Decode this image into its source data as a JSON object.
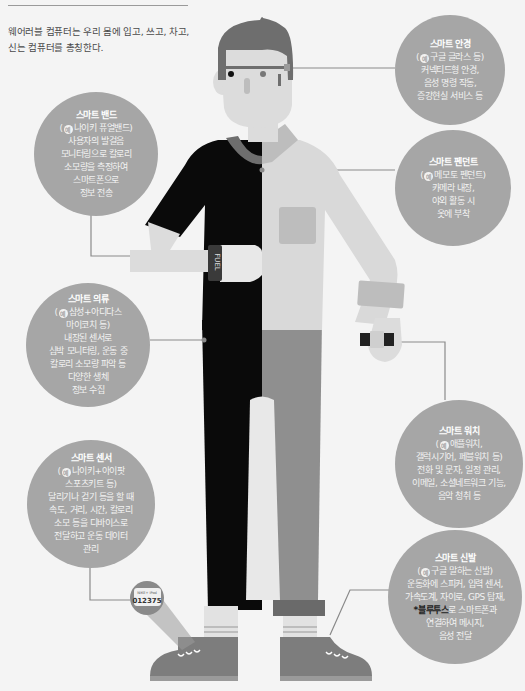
{
  "intro": {
    "line1": "웨어러블 컴퓨터는 우리 몸에 입고, 쓰고, 차고,",
    "line2": "신는 컴퓨터를 총칭한다."
  },
  "example_badge": "예",
  "callouts": {
    "glasses": {
      "title": "스마트 안경",
      "example": "구글 글라스 등)",
      "lines": [
        "커넥티드형 안경,",
        "음성 명령 작동,",
        "증강현실 서비스 등"
      ]
    },
    "band": {
      "title": "스마트 밴드",
      "example": "나이키 퓨얼밴드)",
      "lines": [
        "사용자의 발걸음",
        "모니터링으로 칼로리",
        "소모량을 측정하여",
        "스마트폰으로",
        "정보 전송"
      ]
    },
    "pendant": {
      "title": "스마트 펜던트",
      "example": "메모토 펜던트)",
      "lines": [
        "카메라 내장,",
        "야외 활동 시",
        "옷에 부착"
      ]
    },
    "clothing": {
      "title": "스마트 의류",
      "example": "삼성+아디다스",
      "lines": [
        "마이코치 등)",
        "내장된 센서로",
        "심박 모니터링, 운동 중",
        "칼로리 소모량 파악 등",
        "다양한 생체",
        "정보 수집"
      ]
    },
    "watch": {
      "title": "스마트 워치",
      "example": "애플워치,",
      "lines": [
        "갤럭시기어, 페블워치 등)",
        "전화 및 문자, 일정 관리,",
        "이메일, 소셜네트워크 기능,",
        "음악 청취 등"
      ]
    },
    "sensor": {
      "title": "스마트 센서",
      "example": "나이키+아이팟",
      "lines": [
        "스포츠키트 등)",
        "달리기나 걷기 등을 할 때",
        "속도, 거리, 시간, 칼로리",
        "소모 등을 디바이스로",
        "전달하고 운동 데이터",
        "관리"
      ]
    },
    "shoes": {
      "title": "스마트 신발",
      "example": "구글 말하는 신발)",
      "lines": [
        "운동화에 스피커, 입력 센서,",
        "가속도계, 자이로, GPS 탑재,"
      ],
      "highlight": "*블루투스",
      "highlight_rest": "로 스마트폰과",
      "lines2": [
        "연결하여 메시지,",
        "음성 전달"
      ]
    }
  },
  "figure": {
    "band_text": "FUEL",
    "sensor_display_small": "NIKE+ iPod",
    "sensor_display_number": "012375"
  },
  "colors": {
    "background": "#f4f4f4",
    "bubble": "#a6a6a6",
    "shirt_black": "#0a0a0a",
    "shirt_light": "#d9d9d9",
    "pants_grey": "#8f8f8f",
    "skin": "#dcdcdc",
    "hair": "#6e6e6e",
    "shoe": "#7d7d7d",
    "leader_line": "#8a8a8a"
  }
}
